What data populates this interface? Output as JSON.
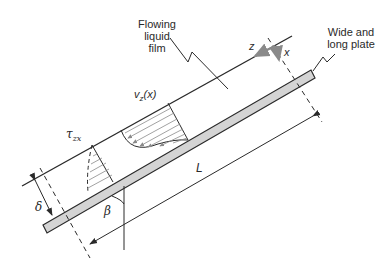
{
  "diagram": {
    "labels": {
      "film_line1": "Flowing",
      "film_line2": "liquid",
      "film_line3": "film",
      "plate_line1": "Wide and",
      "plate_line2": "long plate",
      "velocity": "v",
      "velocity_sub": "z",
      "velocity_arg": "(x)",
      "shear": "τ",
      "shear_sub": "zx",
      "length": "L",
      "thickness": "δ",
      "angle": "β",
      "axis_z": "z",
      "axis_x": "x"
    },
    "colors": {
      "line": "#2a2a2a",
      "plate_fill": "#d4d4d4",
      "arrow_gray": "#8a8a8a",
      "hatch": "#8a8a8a"
    }
  }
}
